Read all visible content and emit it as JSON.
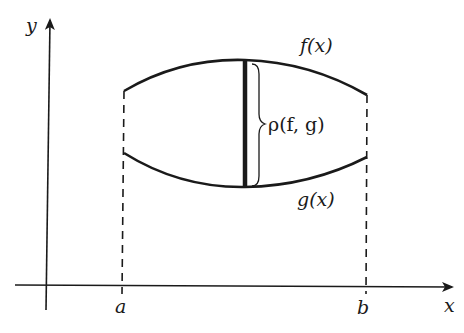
{
  "diagram": {
    "type": "function-distance-figure",
    "axes": {
      "x_label": "x",
      "y_label": "y"
    },
    "interval": {
      "left_label": "a",
      "right_label": "b"
    },
    "curves": {
      "upper_label": "f(x)",
      "lower_label": "g(x)"
    },
    "distance_label": "ρ(f, g)",
    "colors": {
      "line": "#1a1a1a",
      "background": "#ffffff"
    }
  }
}
